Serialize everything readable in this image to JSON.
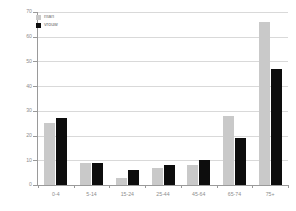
{
  "chart_data": {
    "type": "bar",
    "title": "",
    "xlabel": "",
    "ylabel": "",
    "ylim": [
      0,
      70
    ],
    "yticks": [
      0,
      10,
      20,
      30,
      40,
      50,
      60,
      70
    ],
    "grid": true,
    "legend_position": "top-left",
    "categories": [
      "0-4",
      "5-14",
      "15-24",
      "25-44",
      "45-64",
      "65-74",
      "75+"
    ],
    "series": [
      {
        "name": "man",
        "color": "#c9c9c9",
        "values": [
          25,
          9,
          3,
          7,
          8,
          28,
          66
        ]
      },
      {
        "name": "vrouw",
        "color": "#0d0d0d",
        "values": [
          27,
          9,
          6,
          8,
          10,
          19,
          47
        ]
      }
    ]
  },
  "legend": {
    "items": [
      {
        "label": "man"
      },
      {
        "label": "vrouw"
      }
    ]
  },
  "colors": {
    "man": "#c9c9c9",
    "vrouw": "#0d0d0d",
    "grid": "#d9d9d9",
    "axis": "#9a9a9a",
    "text": "#8d8d8d",
    "background": "#ffffff"
  }
}
